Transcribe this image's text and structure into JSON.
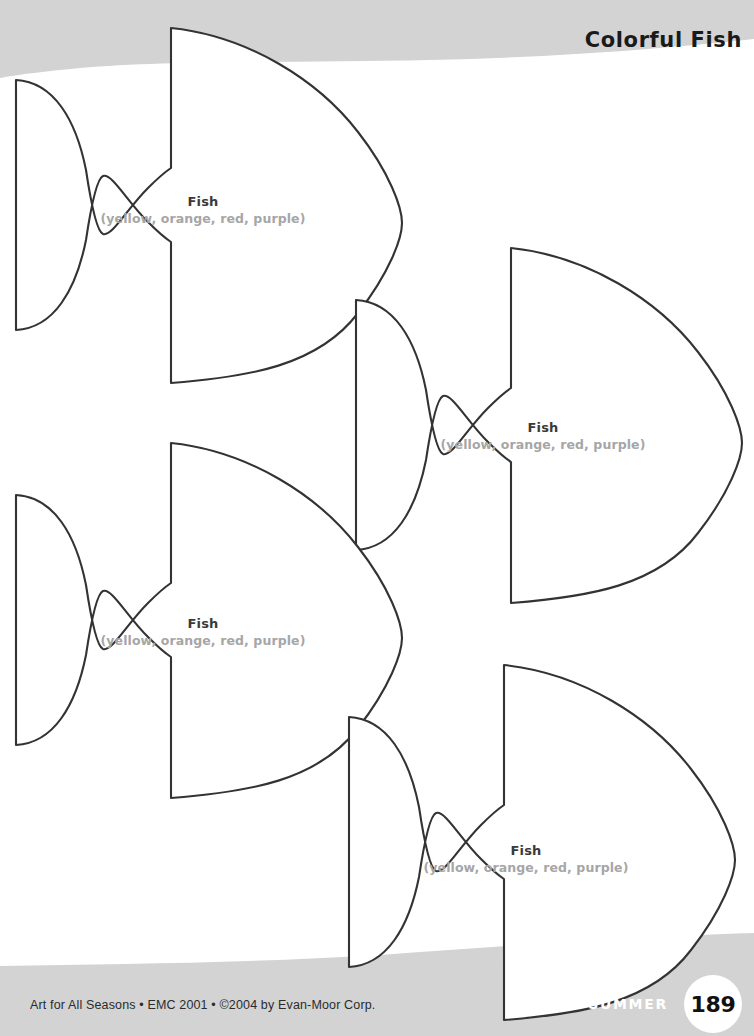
{
  "page": {
    "width": 754,
    "height": 1036,
    "background_color": "#ffffff",
    "band_color": "#d3d3d3",
    "outline_color": "#333333"
  },
  "header": {
    "title": "Colorful Fish",
    "subtitle": "TEMPLATES",
    "title_color": "#1a1a1a",
    "subtitle_color": "#ffffff"
  },
  "footer": {
    "credit": "Art for All Seasons • EMC 2001 • ©2004 by Evan-Moor Corp.",
    "season": "SUMMER",
    "page_number": "189"
  },
  "templates": [
    {
      "id": "fish-1",
      "name": "Fish",
      "colors": "(yellow, orange, red, purple)",
      "icon": "fish-outline-icon"
    },
    {
      "id": "fish-2",
      "name": "Fish",
      "colors": "(yellow, orange, red, purple)",
      "icon": "fish-outline-icon"
    },
    {
      "id": "fish-3",
      "name": "Fish",
      "colors": "(yellow, orange, red, purple)",
      "icon": "fish-outline-icon"
    },
    {
      "id": "fish-4",
      "name": "Fish",
      "colors": "(yellow, orange, red, purple)",
      "icon": "fish-outline-icon"
    }
  ]
}
